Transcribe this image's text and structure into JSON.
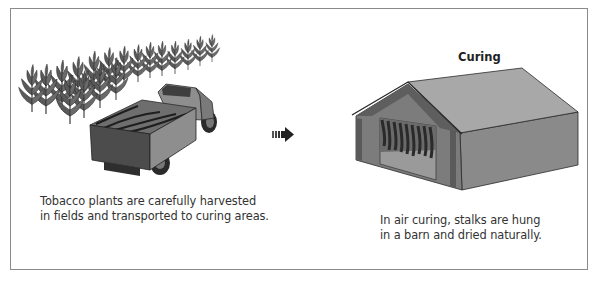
{
  "figure": {
    "steps": [
      {
        "id": "harvesting",
        "title": "",
        "caption_lines": [
          "Tobacco plants are carefully harvested",
          "in fields and transported to curing areas."
        ],
        "illustration": "tobacco-field-and-truck"
      },
      {
        "id": "curing",
        "title": "Curing",
        "caption_lines": [
          "In air curing, stalks are hung",
          "in a barn and dried naturally."
        ],
        "illustration": "curing-barn"
      }
    ],
    "connector": "arrow-right-icon",
    "colors": {
      "border": "#8a8a8a",
      "roof_light": "#a8a8a8",
      "roof_dark": "#7a7a7a",
      "wall": "#8c8c8c",
      "wall_dark": "#6e6e6e",
      "leaf": "#4a4a4a",
      "text": "#333333"
    }
  }
}
